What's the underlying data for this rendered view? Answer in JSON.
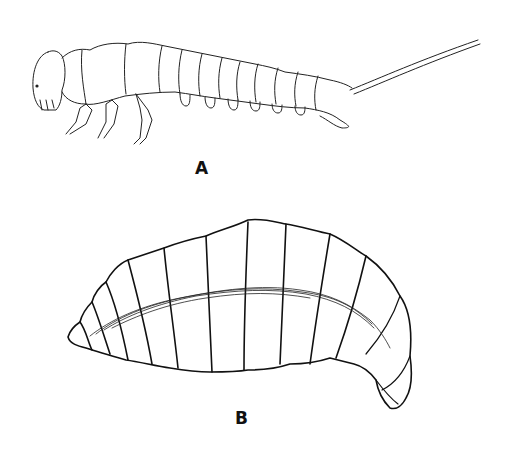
{
  "figure": {
    "panels": [
      {
        "id": "A",
        "label": "A",
        "subject": "larva with legs and long caudal filament (lateral view)"
      },
      {
        "id": "B",
        "label": "B",
        "subject": "legless segmented grub-like larva (lateral view)"
      }
    ]
  },
  "colors": {
    "ink": "#111111",
    "paper": "#ffffff",
    "stipple": "#555555"
  }
}
